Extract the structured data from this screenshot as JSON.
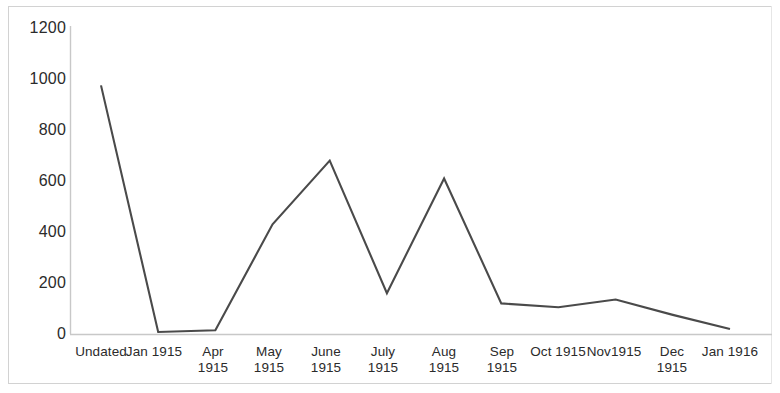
{
  "chart_data": {
    "type": "line",
    "title": "",
    "subtitle": "",
    "xlabel": "",
    "ylabel": "",
    "categories": [
      "Undated",
      "Jan 1915",
      "Apr 1915",
      "May 1915",
      "June 1915",
      "July 1915",
      "Aug 1915",
      "Sep 1915",
      "Oct 1915",
      "Nov1915",
      "Dec 1915",
      "Jan 1916"
    ],
    "category_label_lines": [
      [
        "Undated"
      ],
      [
        "Jan 1915"
      ],
      [
        "Apr",
        "1915"
      ],
      [
        "May",
        "1915"
      ],
      [
        "June",
        "1915"
      ],
      [
        "July",
        "1915"
      ],
      [
        "Aug",
        "1915"
      ],
      [
        "Sep",
        "1915"
      ],
      [
        "Oct 1915"
      ],
      [
        "Nov1915"
      ],
      [
        "Dec",
        "1915"
      ],
      [
        "Jan 1916"
      ]
    ],
    "values": [
      975,
      8,
      15,
      430,
      680,
      160,
      610,
      120,
      105,
      135,
      75,
      20
    ],
    "series": [
      {
        "name": "",
        "values": [
          975,
          8,
          15,
          430,
          680,
          160,
          610,
          120,
          105,
          135,
          75,
          20
        ]
      }
    ],
    "ylim": [
      0,
      1200
    ],
    "yticks": [
      0,
      200,
      400,
      600,
      800,
      1000,
      1200
    ],
    "ytick_labels": [
      "0",
      "200",
      "400",
      "600",
      "800",
      "1000",
      "1200"
    ],
    "grid": false,
    "legend": false,
    "legend_position": "none",
    "line_color": "#4a4a4a",
    "axis_color": "#c8c8c8",
    "text_color": "#2b2b2b",
    "background_color": "#ffffff",
    "marker": "none"
  }
}
